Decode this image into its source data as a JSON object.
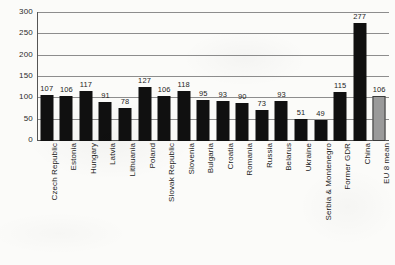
{
  "chart_data": {
    "type": "bar",
    "title": "",
    "subtitle": "",
    "xlabel": "",
    "ylabel": "",
    "ylim": [
      0,
      300
    ],
    "yticks": [
      0,
      50,
      100,
      150,
      200,
      250,
      300
    ],
    "grid": "horizontal",
    "legend": "none",
    "categories": [
      "Czech Republic",
      "Estonia",
      "Hungary",
      "Latvia",
      "Lithuania",
      "Poland",
      "Slovak Republic",
      "Slovenia",
      "Bulgaria",
      "Croatia",
      "Romania",
      "Russia",
      "Belarus",
      "Ukraine",
      "Serbia & Montenegro",
      "Former GDR",
      "China",
      "EU 8 mean"
    ],
    "values": [
      107,
      106,
      117,
      91,
      78,
      127,
      106,
      118,
      95,
      93,
      90,
      73,
      93,
      51,
      49,
      115,
      277,
      106
    ],
    "value_labels": [
      "107",
      "106",
      "117",
      "91",
      "78",
      "127",
      "106",
      "118",
      "95",
      "93",
      "90",
      "73",
      "93",
      "51",
      "49",
      "115",
      "277",
      "106"
    ],
    "bar_colors": [
      "#101010",
      "#101010",
      "#101010",
      "#101010",
      "#101010",
      "#101010",
      "#101010",
      "#101010",
      "#101010",
      "#101010",
      "#101010",
      "#101010",
      "#101010",
      "#101010",
      "#101010",
      "#101010",
      "#101010",
      "#9a9a9a"
    ],
    "highlight_category": "EU 8 mean",
    "highlight_color": "#9a9a9a",
    "series_color": "#101010",
    "grid_color": "#8d8d8d",
    "axis_color": "#555555",
    "background_color": "#fbfbf9"
  }
}
